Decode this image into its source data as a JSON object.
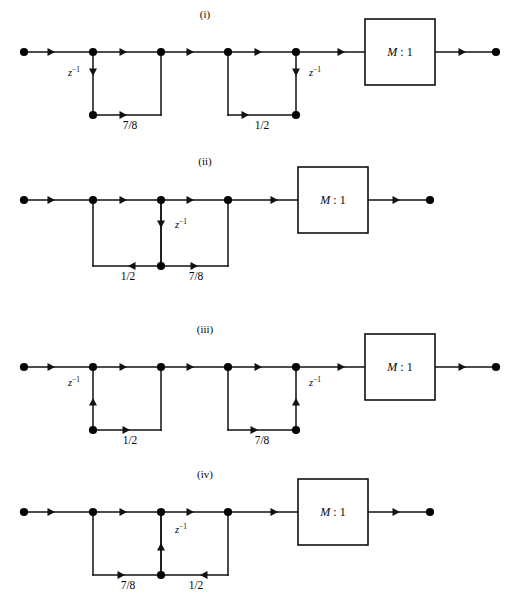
{
  "figure": {
    "background_color": "#ffffff",
    "ink_color": "#111111",
    "width": 511,
    "height": 609
  },
  "labels": {
    "delay": "z",
    "delay_exponent": "-1",
    "decimator_main": "M",
    "decimator_sep": " : ",
    "decimator_ratio": "1"
  },
  "panels": [
    {
      "id": "panel-i",
      "caption": "(i)",
      "caption_x": 205,
      "caption_y": 18,
      "baseline_y": 52,
      "bottom_y": 115,
      "input_dot_x": 24,
      "output_dot_x": 496,
      "box": {
        "x": 365,
        "y": 19,
        "width": 70,
        "height": 66,
        "label": "M : 1"
      },
      "main_nodes": [
        93,
        161,
        228,
        296
      ],
      "main_arrows": [
        {
          "x": 55,
          "dir": "right"
        },
        {
          "x": 127,
          "dir": "right"
        },
        {
          "x": 194,
          "dir": "right"
        },
        {
          "x": 262,
          "dir": "right"
        },
        {
          "x": 345,
          "dir": "right"
        },
        {
          "x": 466,
          "dir": "right"
        }
      ],
      "sections": [
        {
          "id": "section-i-1",
          "left_x": 93,
          "right_x": 161,
          "delay_x": 93,
          "delay_dir": "down",
          "delay_arrow_y": 76,
          "delay_label_x": 74,
          "delay_label_y": 76,
          "bottom_node_x": 93,
          "bottom_arrow_x": 127,
          "bottom_dir": "right",
          "gain": "7/8",
          "gain_x": 130,
          "gain_y": 129
        },
        {
          "id": "section-i-2",
          "left_x": 228,
          "right_x": 296,
          "delay_x": 296,
          "delay_dir": "down",
          "delay_arrow_y": 76,
          "delay_label_x": 315,
          "delay_label_y": 76,
          "bottom_node_x": 296,
          "bottom_arrow_x": 249,
          "bottom_dir": "right",
          "gain": "1/2",
          "gain_x": 262,
          "gain_y": 129
        }
      ]
    },
    {
      "id": "panel-ii",
      "caption": "(ii)",
      "caption_x": 205,
      "caption_y": 165,
      "baseline_y": 200,
      "bottom_y": 266,
      "input_dot_x": 24,
      "output_dot_x": 430,
      "box": {
        "x": 298,
        "y": 167,
        "width": 70,
        "height": 66,
        "label": "M : 1"
      },
      "main_nodes": [
        93,
        161,
        228
      ],
      "main_arrows": [
        {
          "x": 55,
          "dir": "right"
        },
        {
          "x": 127,
          "dir": "right"
        },
        {
          "x": 194,
          "dir": "right"
        },
        {
          "x": 278,
          "dir": "right"
        },
        {
          "x": 400,
          "dir": "right"
        }
      ],
      "sections": [
        {
          "id": "section-ii-1",
          "left_x": 93,
          "right_x": 161,
          "delay_x": 161,
          "delay_dir": "down",
          "delay_arrow_y": 228,
          "delay_label_x": 181,
          "delay_label_y": 228,
          "bottom_node_x": 161,
          "bottom_arrow_x": 128,
          "bottom_dir": "left",
          "gain": "1/2",
          "gain_x": 128,
          "gain_y": 280
        },
        {
          "id": "section-ii-2",
          "left_x": 161,
          "right_x": 228,
          "delay_x": null,
          "delay_dir": null,
          "bottom_node_x": 161,
          "bottom_arrow_x": 198,
          "bottom_dir": "right",
          "gain": "7/8",
          "gain_x": 196,
          "gain_y": 280
        }
      ]
    },
    {
      "id": "panel-iii",
      "caption": "(iii)",
      "caption_x": 205,
      "caption_y": 333,
      "baseline_y": 367,
      "bottom_y": 430,
      "input_dot_x": 24,
      "output_dot_x": 496,
      "box": {
        "x": 365,
        "y": 334,
        "width": 70,
        "height": 66,
        "label": "M : 1"
      },
      "main_nodes": [
        93,
        161,
        228,
        296
      ],
      "main_arrows": [
        {
          "x": 55,
          "dir": "right"
        },
        {
          "x": 127,
          "dir": "right"
        },
        {
          "x": 194,
          "dir": "right"
        },
        {
          "x": 262,
          "dir": "right"
        },
        {
          "x": 345,
          "dir": "right"
        },
        {
          "x": 466,
          "dir": "right"
        }
      ],
      "sections": [
        {
          "id": "section-iii-1",
          "left_x": 93,
          "right_x": 161,
          "delay_x": 93,
          "delay_dir": "up",
          "delay_arrow_y": 398,
          "delay_label_x": 74,
          "delay_label_y": 386,
          "bottom_node_x": 93,
          "bottom_arrow_x": 130,
          "bottom_dir": "right",
          "gain": "1/2",
          "gain_x": 130,
          "gain_y": 444
        },
        {
          "id": "section-iii-2",
          "left_x": 228,
          "right_x": 296,
          "delay_x": 296,
          "delay_dir": "up",
          "delay_arrow_y": 398,
          "delay_label_x": 315,
          "delay_label_y": 386,
          "bottom_node_x": 296,
          "bottom_arrow_x": 258,
          "bottom_dir": "right",
          "gain": "7/8",
          "gain_x": 262,
          "gain_y": 444
        }
      ]
    },
    {
      "id": "panel-iv",
      "caption": "(iv)",
      "caption_x": 205,
      "caption_y": 478,
      "baseline_y": 512,
      "bottom_y": 575,
      "input_dot_x": 24,
      "output_dot_x": 430,
      "box": {
        "x": 298,
        "y": 479,
        "width": 70,
        "height": 66,
        "label": "M : 1"
      },
      "main_nodes": [
        93,
        161,
        228
      ],
      "main_arrows": [
        {
          "x": 55,
          "dir": "right"
        },
        {
          "x": 127,
          "dir": "right"
        },
        {
          "x": 194,
          "dir": "right"
        },
        {
          "x": 278,
          "dir": "right"
        },
        {
          "x": 400,
          "dir": "right"
        }
      ],
      "sections": [
        {
          "id": "section-iv-1",
          "left_x": 93,
          "right_x": 161,
          "delay_x": 161,
          "delay_dir": "up",
          "delay_arrow_y": 543,
          "delay_label_x": 181,
          "delay_label_y": 533,
          "bottom_node_x": 161,
          "bottom_arrow_x": 125,
          "bottom_dir": "right",
          "gain": "7/8",
          "gain_x": 128,
          "gain_y": 589
        },
        {
          "id": "section-iv-2",
          "left_x": 161,
          "right_x": 228,
          "delay_x": null,
          "delay_dir": null,
          "bottom_node_x": 161,
          "bottom_arrow_x": 200,
          "bottom_dir": "left",
          "gain": "1/2",
          "gain_x": 196,
          "gain_y": 589
        }
      ]
    }
  ]
}
